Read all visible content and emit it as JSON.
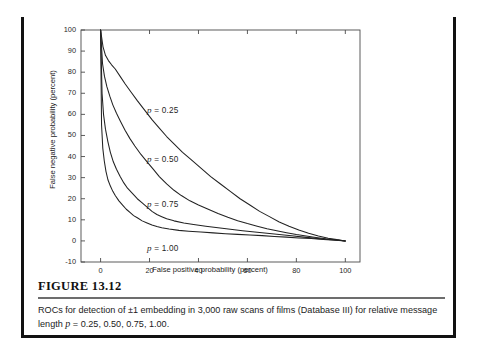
{
  "figure": {
    "number_label": "FIGURE 13.12",
    "caption_part1": "ROCs for detection of ±1 embedding in 3,000 raw scans of films (Database III) for relative message length ",
    "caption_symbol": "p",
    "caption_part2": " = 0.25, 0.50, 0.75, 1.00."
  },
  "chart_data": {
    "type": "line",
    "title": "",
    "subtitle": "",
    "xlabel": "False positive probability (percent)",
    "ylabel": "False negative probability (percent)",
    "xlim": [
      -8,
      106
    ],
    "ylim": [
      -10,
      100
    ],
    "xticks": [
      0,
      20,
      40,
      60,
      80,
      100
    ],
    "xtick_labels": [
      "0",
      "20",
      "40",
      "60",
      "80",
      "100"
    ],
    "yticks": [
      -10,
      0,
      10,
      20,
      30,
      40,
      50,
      60,
      70,
      80,
      90,
      100
    ],
    "ytick_labels": [
      "-10",
      "0",
      "10",
      "20",
      "30",
      "40",
      "50",
      "60",
      "70",
      "80",
      "90",
      "100"
    ],
    "grid": false,
    "legend_position": "inline-annotations",
    "line_color": "#222222",
    "series": [
      {
        "name": "p = 0.25",
        "param_symbol": "p",
        "param_eq": " = 0.25",
        "label_x": 19,
        "label_y": 62,
        "points": [
          [
            0,
            100
          ],
          [
            1.0,
            92.0
          ],
          [
            2.0,
            88.0
          ],
          [
            3.2,
            85.5
          ],
          [
            4.5,
            83.5
          ],
          [
            6.0,
            81.5
          ],
          [
            8.0,
            78.0
          ],
          [
            10.0,
            74.5
          ],
          [
            12.5,
            70.5
          ],
          [
            15.0,
            66.5
          ],
          [
            18.0,
            62.0
          ],
          [
            21.0,
            57.5
          ],
          [
            24.0,
            53.5
          ],
          [
            27.0,
            49.5
          ],
          [
            30.0,
            46.0
          ],
          [
            33.5,
            42.0
          ],
          [
            37.0,
            38.5
          ],
          [
            41.0,
            34.5
          ],
          [
            45.0,
            30.5
          ],
          [
            49.0,
            27.0
          ],
          [
            53.0,
            23.5
          ],
          [
            57.0,
            20.0
          ],
          [
            61.0,
            17.0
          ],
          [
            65.0,
            14.0
          ],
          [
            69.0,
            11.5
          ],
          [
            73.0,
            9.0
          ],
          [
            77.0,
            7.0
          ],
          [
            81.0,
            5.2
          ],
          [
            85.0,
            3.6
          ],
          [
            89.0,
            2.3
          ],
          [
            93.0,
            1.3
          ],
          [
            96.5,
            0.6
          ],
          [
            100,
            0
          ]
        ]
      },
      {
        "name": "p = 0.50",
        "param_symbol": "p",
        "param_eq": " = 0.50",
        "label_x": 19,
        "label_y": 39,
        "points": [
          [
            0,
            100
          ],
          [
            0.8,
            84.0
          ],
          [
            1.6,
            78.0
          ],
          [
            2.6,
            73.0
          ],
          [
            3.8,
            68.5
          ],
          [
            5.0,
            64.5
          ],
          [
            6.5,
            60.5
          ],
          [
            8.0,
            57.0
          ],
          [
            10.0,
            52.5
          ],
          [
            12.0,
            48.5
          ],
          [
            14.0,
            45.0
          ],
          [
            16.5,
            41.0
          ],
          [
            19.0,
            37.5
          ],
          [
            21.5,
            34.0
          ],
          [
            24.0,
            30.5
          ],
          [
            27.0,
            27.0
          ],
          [
            30.0,
            24.0
          ],
          [
            33.0,
            21.5
          ],
          [
            36.5,
            19.0
          ],
          [
            40.0,
            17.0
          ],
          [
            44.0,
            15.0
          ],
          [
            48.0,
            13.0
          ],
          [
            52.0,
            11.2
          ],
          [
            56.0,
            9.6
          ],
          [
            60.0,
            8.2
          ],
          [
            64.0,
            7.0
          ],
          [
            68.0,
            5.8
          ],
          [
            72.0,
            4.8
          ],
          [
            76.0,
            3.9
          ],
          [
            80.0,
            3.0
          ],
          [
            84.0,
            2.3
          ],
          [
            88.0,
            1.6
          ],
          [
            92.0,
            1.0
          ],
          [
            96.0,
            0.5
          ],
          [
            100,
            0
          ]
        ]
      },
      {
        "name": "p = 0.75",
        "param_symbol": "p",
        "param_eq": " = 0.75",
        "label_x": 19,
        "label_y": 17.5,
        "points": [
          [
            0,
            100
          ],
          [
            0.6,
            70.0
          ],
          [
            1.2,
            60.0
          ],
          [
            2.0,
            53.0
          ],
          [
            3.0,
            47.0
          ],
          [
            4.0,
            42.0
          ],
          [
            5.2,
            37.5
          ],
          [
            6.5,
            34.0
          ],
          [
            8.0,
            30.5
          ],
          [
            9.5,
            27.5
          ],
          [
            11.0,
            25.0
          ],
          [
            13.0,
            22.5
          ],
          [
            15.0,
            20.0
          ],
          [
            17.0,
            18.0
          ],
          [
            19.0,
            16.0
          ],
          [
            21.0,
            14.0
          ],
          [
            23.0,
            12.5
          ],
          [
            25.0,
            11.5
          ],
          [
            27.0,
            10.5
          ],
          [
            30.0,
            9.5
          ],
          [
            34.0,
            8.5
          ],
          [
            38.0,
            7.8
          ],
          [
            43.0,
            7.0
          ],
          [
            48.0,
            6.2
          ],
          [
            53.0,
            5.5
          ],
          [
            58.0,
            4.8
          ],
          [
            63.0,
            4.2
          ],
          [
            68.0,
            3.6
          ],
          [
            73.0,
            3.0
          ],
          [
            78.0,
            2.4
          ],
          [
            83.0,
            1.8
          ],
          [
            88.0,
            1.2
          ],
          [
            93.0,
            0.7
          ],
          [
            97.0,
            0.3
          ],
          [
            100,
            0
          ]
        ]
      },
      {
        "name": "p = 1.00",
        "param_symbol": "p",
        "param_eq": " = 1.00",
        "label_x": 19,
        "label_y": -3.5,
        "points": [
          [
            0,
            100
          ],
          [
            0.4,
            55.0
          ],
          [
            0.9,
            44.0
          ],
          [
            1.5,
            38.0
          ],
          [
            2.2,
            33.0
          ],
          [
            3.0,
            29.0
          ],
          [
            4.0,
            26.0
          ],
          [
            5.0,
            23.5
          ],
          [
            6.0,
            21.5
          ],
          [
            7.5,
            19.0
          ],
          [
            9.0,
            17.0
          ],
          [
            10.5,
            15.0
          ],
          [
            12.0,
            13.5
          ],
          [
            13.5,
            12.0
          ],
          [
            15.0,
            11.0
          ],
          [
            17.0,
            9.5
          ],
          [
            19.0,
            8.5
          ],
          [
            21.0,
            7.5
          ],
          [
            23.0,
            6.8
          ],
          [
            25.0,
            6.2
          ],
          [
            28.0,
            5.6
          ],
          [
            32.0,
            5.0
          ],
          [
            36.0,
            4.6
          ],
          [
            41.0,
            4.2
          ],
          [
            46.0,
            3.8
          ],
          [
            51.0,
            3.4
          ],
          [
            56.0,
            3.1
          ],
          [
            61.0,
            2.8
          ],
          [
            66.0,
            2.5
          ],
          [
            71.0,
            2.1
          ],
          [
            76.0,
            1.8
          ],
          [
            81.0,
            1.4
          ],
          [
            86.0,
            1.1
          ],
          [
            91.0,
            0.7
          ],
          [
            96.0,
            0.3
          ],
          [
            100,
            0
          ]
        ]
      }
    ]
  }
}
